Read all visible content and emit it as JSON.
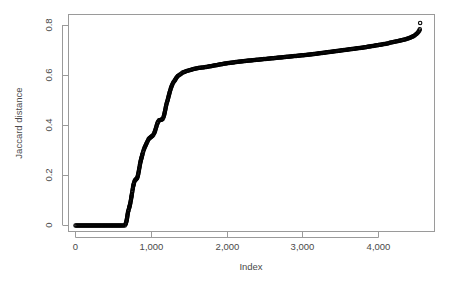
{
  "chart_data": {
    "type": "scatter",
    "title": "",
    "xlabel": "Index",
    "ylabel": "Jaccard distance",
    "xlim": [
      0,
      4600
    ],
    "ylim": [
      0,
      0.85
    ],
    "xticks": [
      0,
      1000,
      2000,
      3000,
      4000
    ],
    "xtick_labels": [
      "0",
      "1,000",
      "2,000",
      "3,000",
      "4,000"
    ],
    "yticks": [
      0,
      0.2,
      0.4,
      0.6,
      0.8
    ],
    "ytick_labels": [
      "0",
      "0.2",
      "0.4",
      "0.6",
      "0.8"
    ],
    "grid": false,
    "legend": null,
    "marker": "open-circle",
    "marker_color": "#000000",
    "point_count_approx": 4550,
    "x": [
      0,
      40,
      80,
      120,
      160,
      200,
      240,
      280,
      320,
      360,
      400,
      440,
      480,
      520,
      560,
      600,
      630,
      650,
      660,
      668,
      675,
      682,
      688,
      694,
      700,
      706,
      712,
      718,
      724,
      730,
      736,
      742,
      748,
      754,
      760,
      766,
      772,
      778,
      784,
      790,
      796,
      802,
      808,
      814,
      820,
      826,
      832,
      838,
      844,
      850,
      856,
      862,
      868,
      874,
      880,
      886,
      892,
      898,
      904,
      910,
      916,
      922,
      928,
      934,
      940,
      948,
      956,
      964,
      972,
      980,
      988,
      996,
      1004,
      1012,
      1020,
      1030,
      1040,
      1050,
      1060,
      1070,
      1080,
      1090,
      1100,
      1110,
      1120,
      1130,
      1140,
      1150,
      1160,
      1170,
      1180,
      1190,
      1200,
      1215,
      1230,
      1245,
      1260,
      1275,
      1290,
      1310,
      1330,
      1350,
      1380,
      1410,
      1450,
      1500,
      1560,
      1620,
      1700,
      1800,
      1900,
      2000,
      2100,
      2200,
      2300,
      2400,
      2500,
      2600,
      2700,
      2800,
      2900,
      3000,
      3100,
      3200,
      3300,
      3400,
      3500,
      3600,
      3700,
      3800,
      3900,
      4000,
      4100,
      4180,
      4260,
      4330,
      4390,
      4430,
      4465,
      4495,
      4520,
      4540,
      4550
    ],
    "y": [
      0,
      0,
      0,
      0,
      0,
      0,
      0,
      0,
      0,
      0,
      0,
      0,
      0,
      0,
      0,
      0,
      0,
      0,
      0.005,
      0.012,
      0.02,
      0.032,
      0.045,
      0.055,
      0.062,
      0.068,
      0.075,
      0.082,
      0.09,
      0.1,
      0.11,
      0.122,
      0.133,
      0.144,
      0.155,
      0.163,
      0.17,
      0.176,
      0.18,
      0.182,
      0.184,
      0.186,
      0.188,
      0.19,
      0.195,
      0.203,
      0.212,
      0.222,
      0.232,
      0.243,
      0.252,
      0.26,
      0.267,
      0.274,
      0.281,
      0.288,
      0.294,
      0.3,
      0.305,
      0.31,
      0.314,
      0.318,
      0.322,
      0.326,
      0.33,
      0.335,
      0.34,
      0.345,
      0.348,
      0.35,
      0.352,
      0.354,
      0.356,
      0.358,
      0.36,
      0.364,
      0.37,
      0.378,
      0.388,
      0.398,
      0.408,
      0.415,
      0.42,
      0.421,
      0.422,
      0.423,
      0.424,
      0.426,
      0.432,
      0.442,
      0.455,
      0.47,
      0.485,
      0.5,
      0.518,
      0.535,
      0.55,
      0.562,
      0.572,
      0.58,
      0.59,
      0.598,
      0.604,
      0.611,
      0.616,
      0.621,
      0.626,
      0.63,
      0.633,
      0.638,
      0.644,
      0.649,
      0.653,
      0.657,
      0.66,
      0.663,
      0.666,
      0.669,
      0.672,
      0.675,
      0.678,
      0.681,
      0.684,
      0.688,
      0.692,
      0.696,
      0.7,
      0.704,
      0.708,
      0.712,
      0.717,
      0.722,
      0.727,
      0.733,
      0.738,
      0.743,
      0.748,
      0.753,
      0.758,
      0.765,
      0.772,
      0.78,
      0.79,
      0.8,
      0.81
    ]
  }
}
